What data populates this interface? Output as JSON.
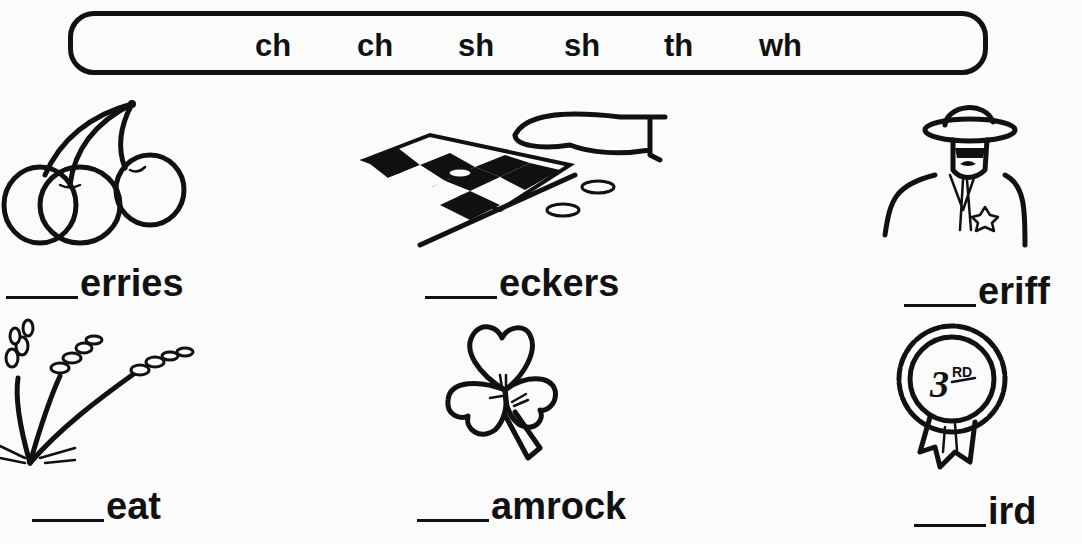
{
  "word_bank": {
    "items": [
      "ch",
      "ch",
      "sh",
      "sh",
      "th",
      "wh"
    ]
  },
  "exercises": [
    {
      "picture": "cherries-icon",
      "blank": "____",
      "suffix": "erries"
    },
    {
      "picture": "checkers-icon",
      "blank": "____",
      "suffix": "eckers"
    },
    {
      "picture": "sheriff-icon",
      "blank": "____",
      "suffix": "eriff"
    },
    {
      "picture": "wheat-icon",
      "blank": "____",
      "suffix": "eat"
    },
    {
      "picture": "shamrock-icon",
      "blank": "____",
      "suffix": "amrock"
    },
    {
      "picture": "third-place-ribbon-icon",
      "blank": "____",
      "suffix": "ird",
      "ribbon_text": "3RD"
    }
  ]
}
